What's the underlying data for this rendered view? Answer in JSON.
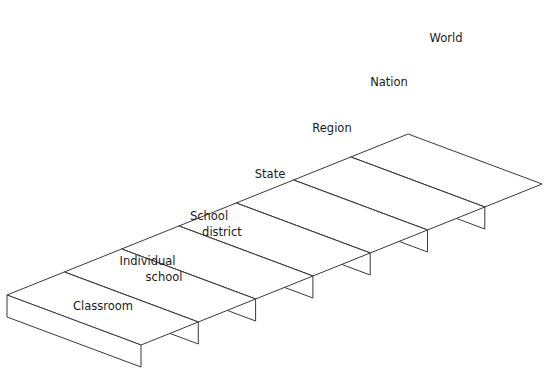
{
  "diagram": {
    "type": "staircase",
    "colors": {
      "stroke": "#3a3a3a",
      "fill": "#ffffff",
      "text": "#1a1a1a"
    },
    "steps": [
      {
        "id": "classroom",
        "lines": [
          "Classroom",
          ""
        ],
        "label_x": 103,
        "label_y": 306
      },
      {
        "id": "individual-school",
        "lines": [
          "Individual",
          "school"
        ],
        "label_x": 155,
        "label_y": 269
      },
      {
        "id": "school-district",
        "lines": [
          "School",
          "district"
        ],
        "label_x": 215,
        "label_y": 224
      },
      {
        "id": "state",
        "lines": [
          "State",
          ""
        ],
        "label_x": 270,
        "label_y": 174
      },
      {
        "id": "region",
        "lines": [
          "Region",
          ""
        ],
        "label_x": 332,
        "label_y": 128
      },
      {
        "id": "nation",
        "lines": [
          "Nation",
          ""
        ],
        "label_x": 389,
        "label_y": 82
      },
      {
        "id": "world",
        "lines": [
          "World",
          ""
        ],
        "label_x": 446,
        "label_y": 38
      }
    ]
  }
}
